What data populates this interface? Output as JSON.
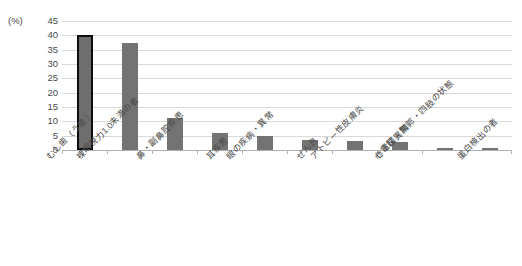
{
  "chart_data": {
    "type": "bar",
    "title": "",
    "subtitle": "",
    "xlabel": "",
    "ylabel": "",
    "unit_label": "(%)",
    "ylim": [
      0,
      45
    ],
    "ytick_step": 5,
    "grid": true,
    "legend": "none",
    "categories": [
      "むし歯（う歯）",
      "裸眼視力1.0未満の者",
      "鼻・副鼻腔疾患",
      "耳疾患",
      "眼の疾病・異常",
      "ぜん息",
      "アトピー性皮膚炎",
      "心電図異常",
      "せき柱・胸郭・四肢の状態",
      "蛋白検出の者"
    ],
    "values": [
      40.2,
      37.5,
      11.0,
      6.0,
      4.8,
      3.5,
      3.3,
      2.7,
      0.8,
      0.8
    ],
    "ytick_labels": [
      "0",
      "5",
      "10",
      "15",
      "20",
      "25",
      "30",
      "35",
      "40",
      "45"
    ],
    "highlight_index": 0,
    "colors": {
      "bar_fill": "#737373",
      "bar_highlight_fill": "#6e6e6e",
      "bar_highlight_border": "#0d0d0d",
      "gridline": "#d9d9d9",
      "baseline": "#b0b0b0",
      "text": "#4a4a4a",
      "background": "#ffffff"
    }
  }
}
